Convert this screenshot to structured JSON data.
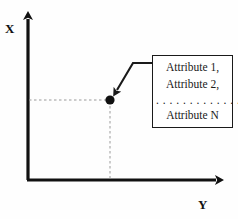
{
  "diagram": {
    "type": "scatter-point-annotation",
    "background_color": "#fefefe",
    "stroke_color": "#1a1a1a",
    "axes": {
      "vertical_label": "X",
      "horizontal_label": "Y",
      "origin": [
        28,
        180
      ],
      "vertical_tip": [
        28,
        10
      ],
      "horizontal_tip": [
        226,
        180
      ]
    },
    "data_point": {
      "x_pixel": 110,
      "y_pixel": 100,
      "radius": 4.5,
      "fill": "#111111"
    },
    "guide_lines": {
      "style": "dashed",
      "color": "#9a9a9a",
      "horizontal_from": [
        28,
        100
      ],
      "horizontal_to": [
        110,
        100
      ],
      "vertical_from": [
        110,
        100
      ],
      "vertical_to": [
        110,
        180
      ]
    },
    "callout": {
      "lines": [
        "Attribute 1,",
        "Attribute 2,",
        "Attribute N"
      ],
      "ellipsis": ". . . . . . . . . . . . .",
      "border_color": "#1a1a1a",
      "fill": "#ffffff"
    },
    "leader_arrow": {
      "path": "M153,63 L133,63 L116,92",
      "arrow_tip": [
        114,
        95
      ],
      "color": "#1a1a1a"
    }
  }
}
